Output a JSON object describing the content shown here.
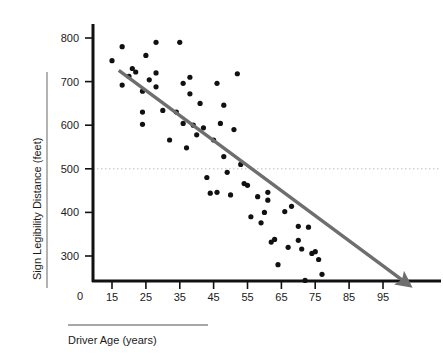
{
  "chart_data": {
    "type": "scatter",
    "title": "",
    "xlabel": "Driver Age (years)",
    "ylabel": "Sign Legibility Distance (feet)",
    "xlim": [
      10,
      103
    ],
    "ylim": [
      200,
      830
    ],
    "xticks": [
      15,
      25,
      35,
      45,
      55,
      65,
      75,
      85,
      95
    ],
    "yticks": [
      300,
      400,
      500,
      600,
      700,
      800
    ],
    "origin_label": "0",
    "grid": false,
    "legend": null,
    "marker_color": "#111111",
    "trendline": {
      "name": "fitted regression line",
      "color": "#6e6e6e",
      "x_start": 17,
      "y_start": 726,
      "x_end": 101,
      "y_end": 243,
      "arrow_end": true
    },
    "reference_line": {
      "name": "500 foot reference",
      "orientation": "horizontal",
      "value": 500,
      "style": "dotted",
      "color": "#b4b4b4"
    },
    "points": [
      [
        15,
        748
      ],
      [
        18,
        780
      ],
      [
        18,
        692
      ],
      [
        20,
        712
      ],
      [
        21,
        730
      ],
      [
        22,
        722
      ],
      [
        24,
        678
      ],
      [
        24,
        630
      ],
      [
        24,
        602
      ],
      [
        25,
        760
      ],
      [
        26,
        704
      ],
      [
        28,
        790
      ],
      [
        28,
        720
      ],
      [
        28,
        688
      ],
      [
        30,
        634
      ],
      [
        32,
        566
      ],
      [
        34,
        630
      ],
      [
        35,
        790
      ],
      [
        36,
        696
      ],
      [
        36,
        604
      ],
      [
        37,
        548
      ],
      [
        38,
        710
      ],
      [
        38,
        672
      ],
      [
        39,
        600
      ],
      [
        40,
        578
      ],
      [
        41,
        650
      ],
      [
        42,
        594
      ],
      [
        43,
        480
      ],
      [
        44,
        444
      ],
      [
        45,
        566
      ],
      [
        46,
        696
      ],
      [
        46,
        446
      ],
      [
        47,
        604
      ],
      [
        48,
        646
      ],
      [
        48,
        528
      ],
      [
        49,
        492
      ],
      [
        50,
        440
      ],
      [
        51,
        590
      ],
      [
        52,
        718
      ],
      [
        53,
        510
      ],
      [
        54,
        466
      ],
      [
        55,
        462
      ],
      [
        56,
        390
      ],
      [
        58,
        436
      ],
      [
        59,
        376
      ],
      [
        60,
        400
      ],
      [
        61,
        446
      ],
      [
        61,
        428
      ],
      [
        62,
        332
      ],
      [
        63,
        338
      ],
      [
        64,
        280
      ],
      [
        66,
        402
      ],
      [
        67,
        320
      ],
      [
        68,
        414
      ],
      [
        70,
        368
      ],
      [
        70,
        336
      ],
      [
        71,
        316
      ],
      [
        73,
        366
      ],
      [
        74,
        306
      ],
      [
        75,
        310
      ],
      [
        76,
        292
      ],
      [
        77,
        258
      ],
      [
        72,
        244
      ]
    ]
  },
  "axes": {
    "y_tick_labels": [
      "800",
      "700",
      "600",
      "500",
      "400",
      "300"
    ],
    "x_tick_labels": [
      "15",
      "25",
      "35",
      "45",
      "55",
      "65",
      "75",
      "85",
      "95"
    ],
    "origin": "0",
    "y_axis_title": "Sign Legibility Distance (feet)",
    "x_axis_title": "Driver Age (years)"
  }
}
